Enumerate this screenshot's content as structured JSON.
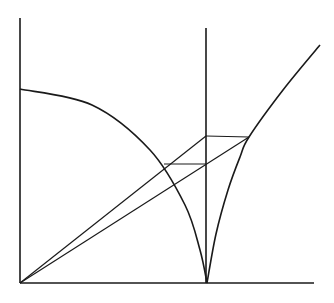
{
  "figure": {
    "canvas": {
      "width": 334,
      "height": 303
    },
    "colors": {
      "background": "#ffffff",
      "stroke": "#1a1a1a"
    }
  },
  "chart_data": {
    "type": "line",
    "title": "",
    "xlabel": "",
    "ylabel": "",
    "grid": false,
    "legend": null,
    "xlim": [
      0,
      334
    ],
    "ylim": [
      0,
      303
    ],
    "points": {
      "origin": [
        20,
        283
      ],
      "y_axis_top": [
        20,
        18
      ],
      "x_axis_right": [
        314,
        283
      ],
      "ordinate_top": [
        206,
        28
      ],
      "cusp": [
        207,
        283
      ],
      "arc_left_start": [
        20,
        89
      ],
      "upper_node": [
        249,
        137
      ],
      "ordinate_upper": [
        206,
        136
      ],
      "ordinate_lower": [
        206,
        164
      ],
      "lower_node": [
        164,
        164
      ],
      "rising_end": [
        320,
        45
      ]
    },
    "series": [
      {
        "name": "y-axis",
        "kind": "segment",
        "values": [
          [
            20,
            18
          ],
          [
            20,
            283
          ]
        ]
      },
      {
        "name": "x-axis",
        "kind": "segment",
        "values": [
          [
            20,
            283
          ],
          [
            314,
            283
          ]
        ]
      },
      {
        "name": "ordinate",
        "kind": "segment",
        "values": [
          [
            206,
            28
          ],
          [
            206,
            283
          ]
        ]
      },
      {
        "name": "descending-arc",
        "kind": "curve",
        "values": [
          [
            20,
            89
          ],
          [
            92,
            105
          ],
          [
            150,
            150
          ],
          [
            185,
            205
          ],
          [
            200,
            250
          ],
          [
            207,
            283
          ]
        ]
      },
      {
        "name": "rising-arc",
        "kind": "curve",
        "values": [
          [
            207,
            283
          ],
          [
            216,
            234
          ],
          [
            228,
            190
          ],
          [
            240,
            157
          ],
          [
            249,
            137
          ],
          [
            283,
            90
          ],
          [
            320,
            45
          ]
        ]
      },
      {
        "name": "chord-to-upper-node",
        "kind": "segment",
        "values": [
          [
            20,
            283
          ],
          [
            249,
            137
          ]
        ]
      },
      {
        "name": "chord-to-ordinate",
        "kind": "segment",
        "values": [
          [
            20,
            283
          ],
          [
            206,
            136
          ]
        ]
      },
      {
        "name": "upper-horizontal",
        "kind": "segment",
        "values": [
          [
            206,
            136
          ],
          [
            249,
            137
          ]
        ]
      },
      {
        "name": "lower-horizontal",
        "kind": "segment",
        "values": [
          [
            164,
            164
          ],
          [
            206,
            164
          ]
        ]
      }
    ]
  }
}
